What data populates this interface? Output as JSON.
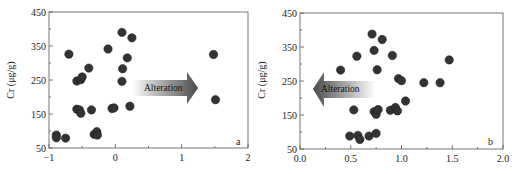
{
  "chart_data": [
    {
      "type": "scatter",
      "panel": "a",
      "title": "",
      "xlabel": "",
      "ylabel": "Cr (μg/g)",
      "xlim": [
        -1,
        2
      ],
      "ylim": [
        50,
        450
      ],
      "xticks": [
        -1,
        0,
        1,
        2
      ],
      "xtick_labels": [
        "−1",
        "0",
        "1",
        "2"
      ],
      "yticks": [
        50,
        150,
        250,
        350,
        450
      ],
      "ytick_labels": [
        "50",
        "150",
        "250",
        "350",
        "450"
      ],
      "grid": false,
      "legend": null,
      "annotations": [
        {
          "text": "Alteration",
          "type": "arrow",
          "direction": "right",
          "x_range": [
            0.25,
            1.25
          ],
          "y": 228
        }
      ],
      "series": [
        {
          "name": "samples",
          "color": "#333333",
          "points": [
            [
              -0.89,
              88
            ],
            [
              -0.89,
              80
            ],
            [
              -0.75,
              79
            ],
            [
              -0.7,
              326
            ],
            [
              -0.58,
              247
            ],
            [
              -0.52,
              251
            ],
            [
              -0.5,
              259
            ],
            [
              -0.4,
              285
            ],
            [
              -0.58,
              164
            ],
            [
              -0.54,
              162
            ],
            [
              -0.52,
              152
            ],
            [
              -0.36,
              162
            ],
            [
              -0.32,
              90
            ],
            [
              -0.28,
              98
            ],
            [
              -0.27,
              88
            ],
            [
              -0.11,
              341
            ],
            [
              -0.05,
              166
            ],
            [
              -0.02,
              168
            ],
            [
              0.1,
              390
            ],
            [
              0.25,
              374
            ],
            [
              0.18,
              315
            ],
            [
              0.11,
              283
            ],
            [
              0.1,
              246
            ],
            [
              0.22,
              173
            ],
            [
              1.48,
              325
            ],
            [
              1.51,
              192
            ]
          ]
        }
      ]
    },
    {
      "type": "scatter",
      "panel": "b",
      "title": "",
      "xlabel": "",
      "ylabel": "Cr (μg/g)",
      "xlim": [
        0.0,
        2.0
      ],
      "ylim": [
        50,
        450
      ],
      "xticks": [
        0.0,
        0.5,
        1.0,
        1.5,
        2.0
      ],
      "xtick_labels": [
        "0.0",
        "0.5",
        "1.0",
        "1.5",
        "2.0"
      ],
      "yticks": [
        50,
        150,
        250,
        350,
        450
      ],
      "ytick_labels": [
        "50",
        "150",
        "250",
        "350",
        "450"
      ],
      "grid": false,
      "legend": null,
      "annotations": [
        {
          "text": "Alteration",
          "type": "arrow",
          "direction": "left",
          "x_range": [
            0.1,
            0.9
          ],
          "y": 232
        }
      ],
      "series": [
        {
          "name": "samples",
          "color": "#333333",
          "points": [
            [
              0.4,
              282
            ],
            [
              0.53,
              165
            ],
            [
              0.56,
              323
            ],
            [
              0.49,
              88
            ],
            [
              0.57,
              90
            ],
            [
              0.59,
              78
            ],
            [
              0.68,
              88
            ],
            [
              0.75,
              96
            ],
            [
              0.71,
              388
            ],
            [
              0.73,
              340
            ],
            [
              0.81,
              372
            ],
            [
              0.76,
              283
            ],
            [
              0.73,
              160
            ],
            [
              0.75,
              152
            ],
            [
              0.77,
              166
            ],
            [
              0.91,
              325
            ],
            [
              0.89,
              164
            ],
            [
              0.94,
              172
            ],
            [
              0.96,
              162
            ],
            [
              0.97,
              257
            ],
            [
              1.0,
              251
            ],
            [
              1.04,
              191
            ],
            [
              1.22,
              245
            ],
            [
              1.38,
              245
            ],
            [
              1.47,
              312
            ]
          ]
        }
      ]
    }
  ],
  "panels": {
    "a": {
      "label": "a",
      "ylabel": "Cr (μg/g)",
      "arrow_text": "Alteration"
    },
    "b": {
      "label": "b",
      "ylabel": "Cr (μg/g)",
      "arrow_text": "Alteration"
    }
  },
  "colors": {
    "marker": "#333333",
    "frame": "#555555",
    "arrow_dark": "#4a4a4a",
    "arrow_light": "#ffffff"
  }
}
